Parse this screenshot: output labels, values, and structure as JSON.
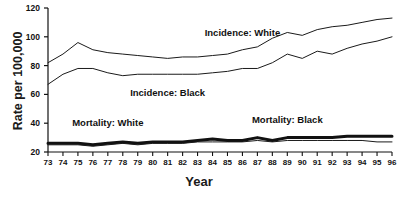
{
  "chart_data": {
    "type": "line",
    "title": "",
    "xlabel": "Year",
    "ylabel": "Rate per 100,000",
    "grid": false,
    "legend_position": "inline-annotations",
    "x": [
      73,
      74,
      75,
      76,
      77,
      78,
      79,
      80,
      81,
      82,
      83,
      84,
      85,
      86,
      87,
      88,
      89,
      90,
      91,
      92,
      93,
      94,
      95,
      96
    ],
    "x_tick_labels": [
      "73",
      "74",
      "75",
      "76",
      "77",
      "78",
      "79",
      "80",
      "81",
      "82",
      "83",
      "84",
      "85",
      "86",
      "87",
      "88",
      "89",
      "90",
      "91",
      "92",
      "93",
      "94",
      "95",
      "96"
    ],
    "y_tick_labels": [
      "20",
      "40",
      "60",
      "80",
      "100",
      "120"
    ],
    "y_ticks": [
      20,
      40,
      60,
      80,
      100,
      120
    ],
    "ylim": [
      20,
      120
    ],
    "xlim": [
      73,
      96
    ],
    "series": [
      {
        "name": "Incidence: White",
        "label": "Incidence: White",
        "line_width": 1,
        "color": "#1a1a1a",
        "label_x": 86,
        "label_y": 103,
        "values": [
          82,
          88,
          96,
          91,
          89,
          88,
          87,
          86,
          85,
          86,
          86,
          87,
          88,
          91,
          93,
          99,
          103,
          101,
          105,
          107,
          108,
          110,
          112,
          113
        ]
      },
      {
        "name": "Incidence: Black",
        "label": "Incidence: Black",
        "line_width": 1,
        "color": "#1a1a1a",
        "label_x": 81,
        "label_y": 62,
        "values": [
          67,
          74,
          78,
          78,
          75,
          73,
          74,
          74,
          74,
          74,
          74,
          75,
          76,
          78,
          78,
          82,
          88,
          85,
          90,
          88,
          92,
          95,
          97,
          100
        ]
      },
      {
        "name": "Mortality: Black",
        "label": "Mortality: Black",
        "line_width": 3,
        "color": "#111111",
        "label_x": 89,
        "label_y": 43,
        "values": [
          26,
          26,
          26,
          25,
          26,
          27,
          26,
          27,
          27,
          27,
          28,
          29,
          28,
          28,
          30,
          28,
          30,
          30,
          30,
          30,
          31,
          31,
          31,
          31
        ]
      },
      {
        "name": "Mortality: White",
        "label": "Mortality: White",
        "line_width": 1,
        "color": "#1a1a1a",
        "label_x": 77,
        "label_y": 41,
        "values": [
          25,
          25,
          25,
          24,
          25,
          26,
          25,
          26,
          26,
          26,
          27,
          27,
          27,
          27,
          28,
          27,
          28,
          28,
          28,
          28,
          28,
          28,
          27,
          27
        ]
      }
    ]
  },
  "axes": {
    "y_title": "Rate per 100,000",
    "x_title": "Year"
  }
}
